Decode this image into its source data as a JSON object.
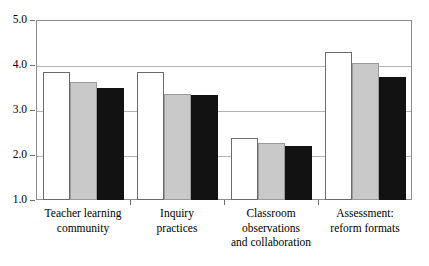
{
  "chart_data": {
    "type": "bar",
    "title": "",
    "xlabel": "",
    "ylabel": "",
    "ylim": [
      1.0,
      5.0
    ],
    "yticks": [
      "1.0",
      "2.0",
      "3.0",
      "4.0",
      "5.0"
    ],
    "ytick_values": [
      1.0,
      2.0,
      3.0,
      4.0,
      5.0
    ],
    "grid": true,
    "legend_position": "none",
    "categories": [
      "Teacher learning community",
      "Inquiry practices",
      "Classroom observations and collaboration",
      "Assessment: reform formats"
    ],
    "category_label_lines": [
      [
        "Teacher learning",
        "community"
      ],
      [
        "Inquiry",
        "practices"
      ],
      [
        "Classroom",
        "observations",
        "and collaboration"
      ],
      [
        "Assessment:",
        "reform formats"
      ]
    ],
    "series": [
      {
        "name": "series-1",
        "color": "#ffffff",
        "values": [
          3.84,
          3.84,
          2.37,
          4.28
        ]
      },
      {
        "name": "series-2",
        "color": "#c9c9c9",
        "values": [
          3.62,
          3.36,
          2.26,
          4.05
        ]
      },
      {
        "name": "series-3",
        "color": "#121212",
        "values": [
          3.49,
          3.33,
          2.2,
          3.73
        ]
      }
    ]
  },
  "colors": {
    "frame": "#8d8d8d",
    "gridline": "#b4b4b4",
    "bar_white": "#ffffff",
    "bar_gray": "#c9c9c9",
    "bar_black": "#121212",
    "text": "#000000",
    "background": "#ffffff"
  }
}
